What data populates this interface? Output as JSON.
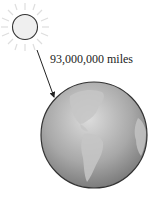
{
  "diagram": {
    "distance_label": "93,000,000 miles",
    "objects": [
      {
        "name": "sun",
        "icon": "sun-icon"
      },
      {
        "name": "earth",
        "icon": "earth-globe-icon"
      }
    ],
    "colors": {
      "sun_fill": "#efefef",
      "sun_stroke": "#333333",
      "ray_color": "#dddddd",
      "earth_light": "#d8d8d8",
      "earth_dark": "#6e6e6e",
      "land": "#c4c4c4",
      "arrow": "#222222"
    }
  }
}
